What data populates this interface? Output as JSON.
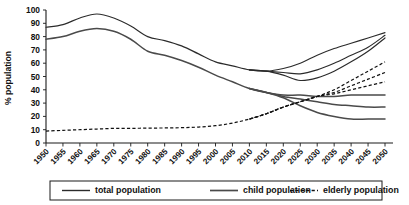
{
  "chart_data": {
    "type": "line",
    "title": "",
    "subtitle": "",
    "xlabel": "",
    "ylabel": "% population",
    "xlim": [
      1950,
      2050
    ],
    "ylim": [
      0,
      100
    ],
    "grid": false,
    "legend_position": "bottom",
    "x": [
      1950,
      1955,
      1960,
      1965,
      1970,
      1975,
      1980,
      1985,
      1990,
      1995,
      2000,
      2005,
      2010,
      2015,
      2020,
      2025,
      2030,
      2035,
      2040,
      2045,
      2050
    ],
    "xticklabels": [
      "1950",
      "1955",
      "1960",
      "1965",
      "1970",
      "1975",
      "1980",
      "1985",
      "1990",
      "1995",
      "2000",
      "2005",
      "2010",
      "2015",
      "2020",
      "2025",
      "2030",
      "2035",
      "2040",
      "2045",
      "2050"
    ],
    "yticklabels": [
      "0",
      "10",
      "20",
      "30",
      "40",
      "50",
      "60",
      "70",
      "80",
      "90",
      "100"
    ],
    "yticks": [
      0,
      10,
      20,
      30,
      40,
      50,
      60,
      70,
      80,
      90,
      100
    ],
    "series": [
      {
        "name": "total population",
        "style": "solid",
        "variant": "high",
        "values": [
          87,
          89,
          94,
          97,
          94,
          88,
          80,
          77,
          73,
          67,
          61,
          58,
          55,
          54,
          56,
          60,
          66,
          71,
          75,
          79,
          83
        ]
      },
      {
        "name": "total population",
        "style": "solid",
        "variant": "medium",
        "values": [
          null,
          null,
          null,
          null,
          null,
          null,
          null,
          null,
          null,
          null,
          null,
          null,
          55,
          54,
          53,
          52,
          55,
          60,
          66,
          72,
          81
        ]
      },
      {
        "name": "total population",
        "style": "solid",
        "variant": "low",
        "values": [
          null,
          null,
          null,
          null,
          null,
          null,
          null,
          null,
          null,
          null,
          null,
          null,
          55,
          54,
          51,
          47,
          49,
          54,
          61,
          69,
          79
        ]
      },
      {
        "name": "child population",
        "style": "solid",
        "variant": "high",
        "values": [
          78,
          80,
          84,
          86,
          84,
          78,
          69,
          66,
          62,
          57,
          51,
          46,
          41,
          38,
          36,
          36,
          35,
          35,
          36,
          36,
          36
        ]
      },
      {
        "name": "child population",
        "style": "solid",
        "variant": "medium",
        "values": [
          null,
          null,
          null,
          null,
          null,
          null,
          null,
          null,
          null,
          null,
          null,
          null,
          41,
          38,
          35,
          33,
          31,
          29,
          28,
          27,
          27
        ]
      },
      {
        "name": "child population",
        "style": "solid",
        "variant": "low",
        "values": [
          null,
          null,
          null,
          null,
          null,
          null,
          null,
          null,
          null,
          null,
          null,
          null,
          41,
          38,
          34,
          28,
          23,
          20,
          18,
          18,
          18
        ]
      },
      {
        "name": "elderly population",
        "style": "dashed",
        "variant": "high",
        "values": [
          9,
          9.5,
          10,
          10.5,
          11,
          11,
          11.2,
          11.3,
          11.5,
          12,
          13,
          15,
          18,
          22,
          27,
          31,
          35,
          40,
          47,
          54,
          61
        ]
      },
      {
        "name": "elderly population",
        "style": "dashed",
        "variant": "medium",
        "values": [
          null,
          null,
          null,
          null,
          null,
          null,
          null,
          null,
          null,
          null,
          null,
          null,
          18,
          22,
          27,
          31,
          35,
          38,
          43,
          48,
          53
        ]
      },
      {
        "name": "elderly population",
        "style": "dashed",
        "variant": "low",
        "values": [
          null,
          null,
          null,
          null,
          null,
          null,
          null,
          null,
          null,
          null,
          null,
          null,
          18,
          22,
          27,
          31,
          35,
          37,
          40,
          43,
          46
        ]
      }
    ],
    "legend": [
      {
        "label": "total population",
        "style": "solid"
      },
      {
        "label": "child population",
        "style": "solid"
      },
      {
        "label": "elderly population",
        "style": "dashed"
      }
    ],
    "colors": {
      "total": "#2b2b2b",
      "child": "#4a4a4a",
      "elderly": "#111111",
      "axis": "#1a1a1a",
      "background": "#ffffff"
    }
  }
}
